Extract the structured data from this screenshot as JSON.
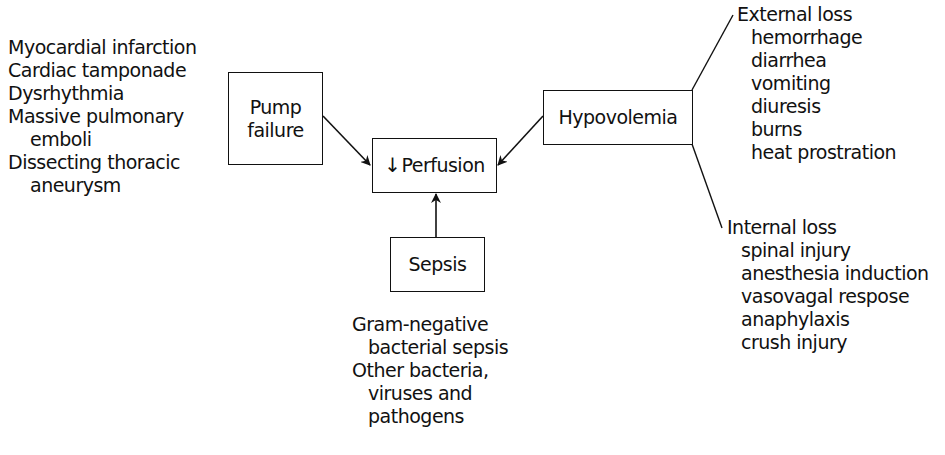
{
  "diagram": {
    "center_node": {
      "prefix_symbol": "↓",
      "label": "Perfusion"
    },
    "nodes": {
      "pump": {
        "label_line1": "Pump",
        "label_line2": "failure"
      },
      "hypovolemia": {
        "label": "Hypovolemia"
      },
      "sepsis": {
        "label": "Sepsis"
      }
    },
    "pump_causes": [
      {
        "text": "Myocardial infarction"
      },
      {
        "text": "Cardiac tamponade"
      },
      {
        "text": "Dysrhythmia"
      },
      {
        "text": "Massive pulmonary"
      },
      {
        "text": "emboli"
      },
      {
        "text": "Dissecting thoracic"
      },
      {
        "text": "aneurysm"
      }
    ],
    "external_loss": {
      "heading": "External loss",
      "items": [
        "hemorrhage",
        "diarrhea",
        "vomiting",
        "diuresis",
        "burns",
        "heat prostration"
      ]
    },
    "internal_loss": {
      "heading": "Internal loss",
      "items": [
        "spinal injury",
        "anesthesia induction",
        "vasovagal respose",
        "anaphylaxis",
        "crush injury"
      ]
    },
    "sepsis_causes": [
      {
        "text": "Gram-negative"
      },
      {
        "text": "bacterial sepsis"
      },
      {
        "text": "Other bacteria,"
      },
      {
        "text": "viruses and"
      },
      {
        "text": "pathogens"
      }
    ]
  }
}
